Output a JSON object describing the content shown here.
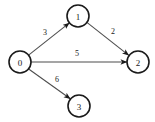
{
  "figure": {
    "kind": "directed-weighted-graph",
    "background_color": "#ffffff",
    "node_stroke_color": "#1a1a1a",
    "node_fill_color": "#ffffff",
    "edge_color": "#4d4d4d",
    "label_color": "#1a1a1a"
  },
  "nodes": [
    {
      "id": "0",
      "label": "0",
      "cx": 20,
      "cy": 62,
      "r": 11
    },
    {
      "id": "1",
      "label": "1",
      "cx": 78,
      "cy": 16,
      "r": 11
    },
    {
      "id": "2",
      "label": "2",
      "cx": 138,
      "cy": 62,
      "r": 11
    },
    {
      "id": "3",
      "label": "3",
      "cx": 79,
      "cy": 106,
      "r": 11
    }
  ],
  "edges": [
    {
      "id": "edge-0-1",
      "source": "0",
      "target": "1",
      "weight": "3",
      "x1": 28.6,
      "y1": 55.1,
      "x2": 69.4,
      "y2": 22.9,
      "label_x": 45,
      "label_y": 32
    },
    {
      "id": "edge-1-2",
      "source": "1",
      "target": "2",
      "weight": "2",
      "x1": 87.2,
      "y1": 22.6,
      "x2": 128.8,
      "y2": 55.4,
      "label_x": 113,
      "label_y": 31
    },
    {
      "id": "edge-0-2",
      "source": "0",
      "target": "2",
      "weight": "5",
      "x1": 31,
      "y1": 62,
      "x2": 127,
      "y2": 62,
      "label_x": 77,
      "label_y": 53
    },
    {
      "id": "edge-0-3",
      "source": "0",
      "target": "3",
      "weight": "6",
      "x1": 28.3,
      "y1": 68.8,
      "x2": 70.3,
      "y2": 98.8,
      "label_x": 57,
      "label_y": 79
    }
  ]
}
